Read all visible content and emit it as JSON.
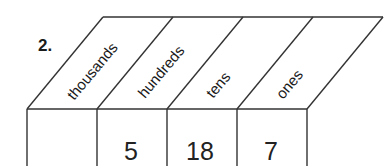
{
  "problem": {
    "number": "2."
  },
  "place_value_chart": {
    "columns": [
      {
        "header": "thousands",
        "value": ""
      },
      {
        "header": "hundreds",
        "value": "5"
      },
      {
        "header": "tens",
        "value": "18"
      },
      {
        "header": "ones",
        "value": "7"
      }
    ]
  },
  "colors": {
    "line": "#333333",
    "text": "#1a1a1a"
  }
}
